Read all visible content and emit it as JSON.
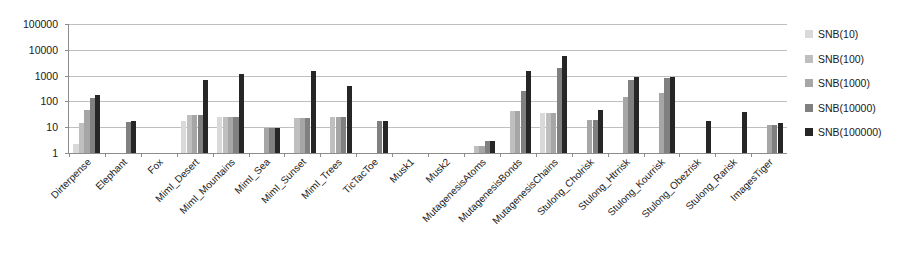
{
  "chart_data": {
    "type": "bar",
    "title": "",
    "subtitle": "",
    "xlabel": "",
    "ylabel": "",
    "grid": true,
    "yscale": "log",
    "ylim": [
      1,
      100000
    ],
    "ytick_labels": [
      "100000",
      "10000",
      "1000",
      "100",
      "10",
      "1"
    ],
    "ytick_values": [
      100000,
      10000,
      1000,
      100,
      10,
      1
    ],
    "legend_position": "right",
    "categories": [
      "Dirterpense",
      "Elephant",
      "Fox",
      "MimI_Desert",
      "MimI_Mountains",
      "MimI_Sea",
      "MimI_Sunset",
      "MimI_Trees",
      "TicTacToe",
      "Musk1",
      "Musk2",
      "MutagenesisAtoms",
      "MutagenesisBonds",
      "MutagenesisChains",
      "Stulong_Cholrisk",
      "Stulong_Htrrisk",
      "Stulong_Kourrisk",
      "Stulong_Obezrisk",
      "Stulong_Rarisk",
      "ImagesTiger"
    ],
    "series": [
      {
        "name": "SNB(10)",
        "color": "#d9d9d9",
        "values": [
          2.2,
          1,
          1,
          17,
          26,
          1,
          1,
          1,
          1,
          1,
          1,
          1,
          1,
          35,
          1,
          1,
          1,
          1,
          1,
          1
        ]
      },
      {
        "name": "SNB(100)",
        "color": "#bfbfbf",
        "values": [
          15,
          1,
          1,
          30,
          26,
          1,
          22,
          25,
          1,
          1,
          1,
          1.9,
          42,
          35,
          1,
          1,
          1,
          1,
          1,
          1
        ]
      },
      {
        "name": "SNB(1000)",
        "color": "#a6a6a6",
        "values": [
          48,
          1,
          1,
          30,
          26,
          9,
          22,
          25,
          1,
          1,
          1,
          1.9,
          42,
          35,
          19,
          150,
          210,
          1,
          1,
          12
        ]
      },
      {
        "name": "SNB(10000)",
        "color": "#808080",
        "values": [
          130,
          16,
          1,
          30,
          26,
          9,
          22,
          25,
          18,
          1,
          1,
          2.8,
          250,
          1900,
          19,
          680,
          800,
          1,
          1,
          12
        ]
      },
      {
        "name": "SNB(100000)",
        "color": "#262626",
        "values": [
          170,
          17,
          1,
          700,
          1150,
          9,
          1450,
          390,
          18,
          1,
          1,
          2.8,
          1500,
          6000,
          45,
          860,
          880,
          17,
          38,
          14
        ]
      }
    ]
  },
  "legend": {
    "items": [
      {
        "label": "SNB(10)",
        "color": "#d9d9d9"
      },
      {
        "label": "SNB(100)",
        "color": "#bfbfbf"
      },
      {
        "label": "SNB(1000)",
        "color": "#a6a6a6"
      },
      {
        "label": "SNB(10000)",
        "color": "#808080"
      },
      {
        "label": "SNB(100000)",
        "color": "#262626"
      }
    ]
  }
}
